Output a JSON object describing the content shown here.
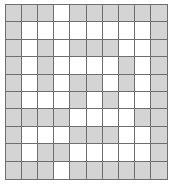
{
  "diagram": {
    "type": "binary-grid",
    "rows": 10,
    "cols": 10,
    "colors": {
      "filled": "#d4d4d4",
      "empty": "#ffffff",
      "gridline": "#6e6e6e",
      "background": "#ffffff"
    },
    "legend": {
      "filled_label": "shaded",
      "empty_label": "blank"
    },
    "counts": {
      "filled": 55,
      "empty": 45,
      "total": 100
    },
    "cells": [
      [
        1,
        1,
        1,
        0,
        1,
        1,
        1,
        1,
        1,
        1
      ],
      [
        1,
        0,
        0,
        0,
        0,
        0,
        0,
        0,
        0,
        1
      ],
      [
        1,
        0,
        1,
        0,
        1,
        1,
        1,
        0,
        0,
        1
      ],
      [
        1,
        0,
        1,
        0,
        0,
        0,
        0,
        1,
        0,
        1
      ],
      [
        1,
        0,
        1,
        0,
        1,
        1,
        0,
        1,
        0,
        1
      ],
      [
        1,
        0,
        0,
        0,
        1,
        0,
        1,
        0,
        0,
        1
      ],
      [
        1,
        1,
        1,
        1,
        0,
        0,
        0,
        0,
        1,
        1
      ],
      [
        1,
        0,
        0,
        0,
        1,
        1,
        1,
        0,
        0,
        1
      ],
      [
        1,
        0,
        1,
        1,
        0,
        0,
        0,
        0,
        0,
        1
      ],
      [
        1,
        1,
        1,
        0,
        1,
        1,
        1,
        1,
        1,
        1
      ]
    ]
  }
}
